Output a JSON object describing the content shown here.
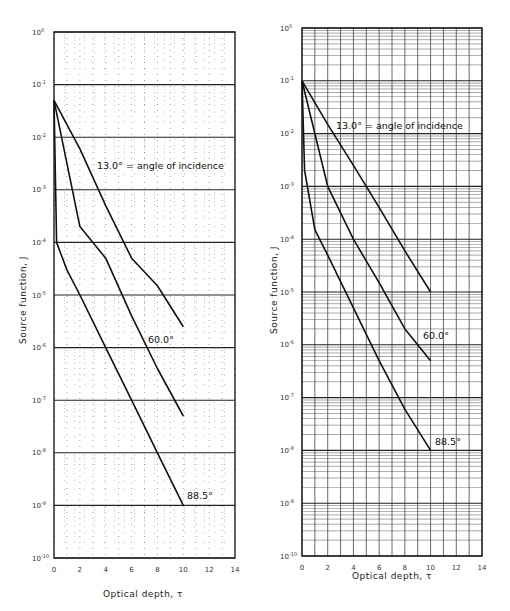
{
  "chart_data": [
    {
      "type": "line",
      "panel": "left",
      "title": "",
      "xlabel": "Optical depth, τ",
      "ylabel": "Source function, J",
      "xlim": [
        0,
        14
      ],
      "ylim": [
        1e-10,
        1
      ],
      "yscale": "log",
      "grid": true,
      "grid_style": "dotted minor grid with solid decade lines",
      "x_ticks": [
        0,
        2,
        4,
        6,
        8,
        10,
        12,
        14
      ],
      "y_ticks": [
        "10^0",
        "10^-1",
        "10^-2",
        "10^-3",
        "10^-4",
        "10^-5",
        "10^-6",
        "10^-7",
        "10^-8",
        "10^-9",
        "10^-10"
      ],
      "legend": [],
      "annotations": [
        "13.0° = angle of incidence",
        "60.0°",
        "88.5°"
      ],
      "series": [
        {
          "name": "13.0°",
          "x": [
            0,
            2,
            4,
            6,
            8,
            10
          ],
          "values": [
            0.05,
            0.006,
            0.0005,
            5e-05,
            1.5e-05,
            2.5e-06
          ]
        },
        {
          "name": "60.0°",
          "x": [
            0,
            2,
            4,
            6,
            8,
            10
          ],
          "values": [
            0.05,
            0.0002,
            5e-05,
            4e-06,
            4e-07,
            5e-08
          ]
        },
        {
          "name": "88.5°",
          "x": [
            0,
            0.2,
            1,
            2,
            4,
            6,
            8,
            10
          ],
          "values": [
            0.05,
            0.0001,
            3e-05,
            1e-05,
            1e-06,
            1e-07,
            1e-08,
            1e-09
          ]
        }
      ]
    },
    {
      "type": "line",
      "panel": "right",
      "title": "",
      "xlabel": "Optical depth, τ",
      "ylabel": "Source function, J",
      "xlim": [
        0,
        14
      ],
      "ylim": [
        1e-10,
        1
      ],
      "yscale": "log",
      "grid": true,
      "grid_style": "solid grid with logarithmic minor lines",
      "x_ticks": [
        0,
        2,
        4,
        6,
        8,
        10,
        12,
        14
      ],
      "y_ticks": [
        "10^0",
        "10^-1",
        "10^-2",
        "10^-3",
        "10^-4",
        "10^-5",
        "10^-6",
        "10^-7",
        "10^-8",
        "10^-9",
        "10^-10"
      ],
      "legend": [],
      "annotations": [
        "13.0° = angle of incidence",
        "60.0°",
        "88.5°"
      ],
      "series": [
        {
          "name": "13.0°",
          "x": [
            0,
            2,
            4,
            6,
            8,
            10
          ],
          "values": [
            0.1,
            0.015,
            0.0025,
            0.0004,
            6e-05,
            1e-05
          ]
        },
        {
          "name": "60.0°",
          "x": [
            0,
            2,
            4,
            6,
            8,
            10
          ],
          "values": [
            0.1,
            0.001,
            0.0001,
            1.5e-05,
            2e-06,
            5e-07
          ]
        },
        {
          "name": "88.5°",
          "x": [
            0,
            0.2,
            1,
            2,
            4,
            6,
            8,
            10
          ],
          "values": [
            0.1,
            0.002,
            0.00015,
            5e-05,
            5e-06,
            5e-07,
            6e-08,
            1e-08
          ]
        }
      ]
    }
  ],
  "panels": {
    "left": {
      "xlabel": "Optical depth, τ",
      "ylabel": "Source function, J",
      "annot_13": "13.0° = angle of incidence",
      "annot_60": "60.0°",
      "annot_88": "88.5°"
    },
    "right": {
      "xlabel": "Optical depth, τ",
      "ylabel": "Source function, J",
      "annot_13": "13.0° = angle of incidence",
      "annot_60": "60.0°",
      "annot_88": "88.5°"
    }
  }
}
